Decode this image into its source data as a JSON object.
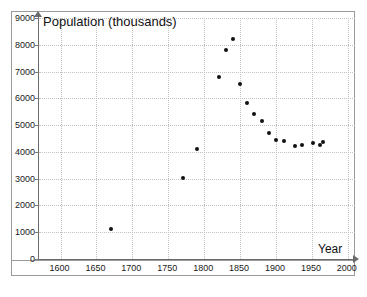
{
  "chart_data": {
    "type": "scatter",
    "title": "Population (thousands)",
    "xlabel": "Year",
    "ylabel": "Population (thousands)",
    "xlim": [
      1570,
      2010
    ],
    "ylim": [
      0,
      9000
    ],
    "grid": true,
    "legend": "none",
    "x_ticks": [
      1600,
      1650,
      1700,
      1750,
      1800,
      1850,
      1900,
      1950,
      2000
    ],
    "y_ticks": [
      0,
      1000,
      2000,
      3000,
      4000,
      5000,
      6000,
      7000,
      8000,
      9000
    ],
    "marker": "filled-circle",
    "marker_color": "#111111",
    "x": [
      1670,
      1770,
      1790,
      1820,
      1830,
      1840,
      1850,
      1860,
      1870,
      1880,
      1890,
      1900,
      1911,
      1926,
      1936,
      1951,
      1961,
      1966
    ],
    "y": [
      1110,
      3020,
      4120,
      6800,
      7800,
      8200,
      6550,
      5820,
      5400,
      5170,
      4700,
      4460,
      4390,
      4230,
      4250,
      4330,
      4250,
      4370
    ],
    "points": [
      {
        "year": 1670,
        "population": 1110
      },
      {
        "year": 1770,
        "population": 3020
      },
      {
        "year": 1790,
        "population": 4120
      },
      {
        "year": 1820,
        "population": 6800
      },
      {
        "year": 1830,
        "population": 7800
      },
      {
        "year": 1840,
        "population": 8200
      },
      {
        "year": 1850,
        "population": 6550
      },
      {
        "year": 1860,
        "population": 5820
      },
      {
        "year": 1870,
        "population": 5400
      },
      {
        "year": 1880,
        "population": 5170
      },
      {
        "year": 1890,
        "population": 4700
      },
      {
        "year": 1900,
        "population": 4460
      },
      {
        "year": 1911,
        "population": 4390
      },
      {
        "year": 1926,
        "population": 4230
      },
      {
        "year": 1936,
        "population": 4250
      },
      {
        "year": 1951,
        "population": 4330
      },
      {
        "year": 1961,
        "population": 4250
      },
      {
        "year": 1966,
        "population": 4370
      }
    ]
  },
  "colors": {
    "marker": "#111111",
    "axis": "#6b6b6b",
    "grid": "#c2c2c2",
    "frame": "#9a9a9a",
    "background": "#ffffff",
    "text": "#1a1a1a"
  }
}
